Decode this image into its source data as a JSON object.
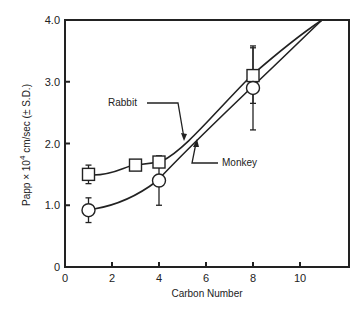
{
  "chart_data": {
    "type": "line",
    "title": "",
    "xlabel": "Carbon Number",
    "ylabel": "Papp × 10⁴ cm/sec (± S.D.)",
    "xlim": [
      0,
      12
    ],
    "ylim": [
      0,
      4.0
    ],
    "x_ticks": [
      0,
      2,
      4,
      6,
      8,
      10
    ],
    "x_tick_labels": [
      "0",
      "2",
      "4",
      "6",
      "8",
      "10"
    ],
    "y_ticks": [
      0,
      1.0,
      2.0,
      3.0,
      4.0
    ],
    "y_tick_labels": [
      "0",
      "1.0",
      "2.0",
      "3.0",
      "4.0"
    ],
    "grid": false,
    "legend": "inline annotations with arrows",
    "series": [
      {
        "name": "Rabbit",
        "marker": "square",
        "x": [
          1,
          3,
          4,
          8
        ],
        "values": [
          1.5,
          1.65,
          1.7,
          3.1
        ],
        "error": [
          0.15,
          null,
          null,
          0.45
        ],
        "curve_extends_to": [
          10.8,
          4.0
        ]
      },
      {
        "name": "Monkey",
        "marker": "circle",
        "x": [
          1,
          4,
          8
        ],
        "values": [
          0.92,
          1.4,
          2.9
        ],
        "error": [
          0.2,
          0.4,
          0.68
        ],
        "curve_extends_to": [
          10.8,
          4.0
        ]
      }
    ],
    "annotations": [
      {
        "text": "Rabbit",
        "points_to": "Rabbit curve near x≈5"
      },
      {
        "text": "Monkey",
        "points_to": "Monkey curve near x≈5.5"
      }
    ]
  }
}
